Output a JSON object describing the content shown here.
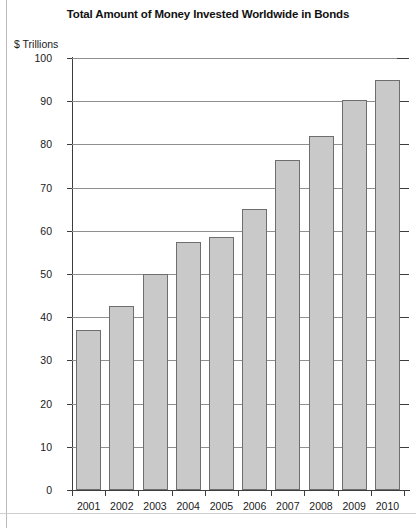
{
  "chart_data": {
    "type": "bar",
    "title": "Total Amount of Money Invested Worldwide in Bonds",
    "xlabel": "",
    "ylabel": "$ Trillions",
    "categories": [
      "2001",
      "2002",
      "2003",
      "2004",
      "2005",
      "2006",
      "2007",
      "2008",
      "2009",
      "2010"
    ],
    "values": [
      37,
      42.5,
      50,
      57.3,
      58.5,
      65,
      76.5,
      82,
      90.3,
      95
    ],
    "ylim": [
      0,
      100
    ],
    "ytick_labels": [
      "100",
      "90",
      "80",
      "70",
      "60",
      "50",
      "40",
      "30",
      "20",
      "10",
      "0"
    ],
    "ytick_values": [
      100,
      90,
      80,
      70,
      60,
      50,
      40,
      30,
      20,
      10,
      0
    ],
    "grid": true,
    "legend": null,
    "bar_color": "#c9c9c9",
    "bar_border_color": "#6e6e6e",
    "axis_color": "#3d3d3d",
    "gridline_color": "#8f8f8f"
  }
}
